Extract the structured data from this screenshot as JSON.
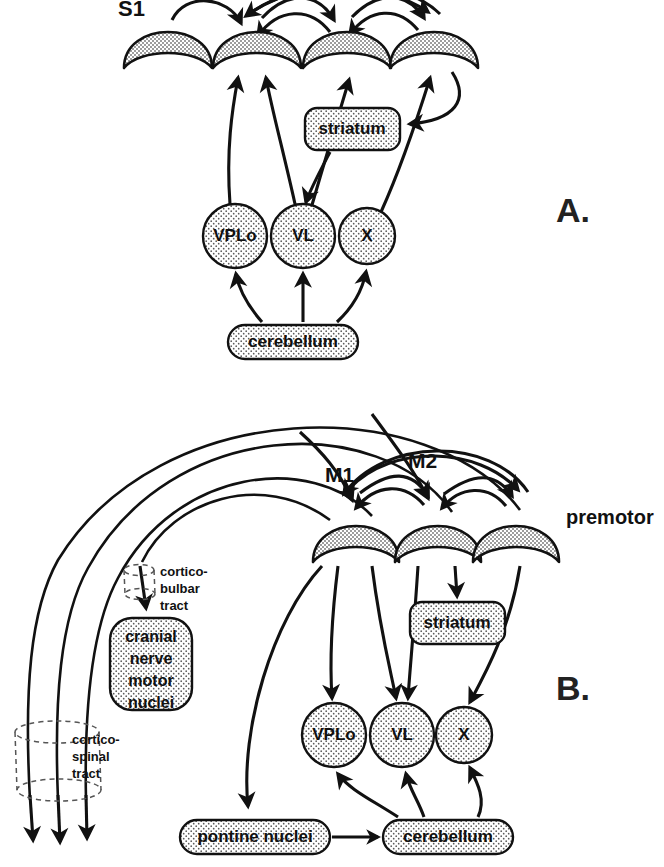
{
  "figure": {
    "background_color": "#ffffff",
    "ink_color": "#111111",
    "cortex_fill": "#c9c9c9",
    "nucleus_fill": "#e9e9e9"
  },
  "panels": [
    {
      "id": "A",
      "label": "A."
    },
    {
      "id": "B",
      "label": "B."
    }
  ],
  "panelA": {
    "panel_label": "A.",
    "cortical_areas": [
      {
        "id": "s1",
        "label": "S1",
        "label_x": 133,
        "label_y": 8,
        "cx": 168,
        "cy": 40
      },
      {
        "id": "a2",
        "label": "",
        "label_x": 0,
        "label_y": 0,
        "cx": 257,
        "cy": 40
      },
      {
        "id": "a3",
        "label": "",
        "label_x": 0,
        "label_y": 0,
        "cx": 347,
        "cy": 40
      },
      {
        "id": "a4",
        "label": "",
        "label_x": 0,
        "label_y": 0,
        "cx": 434,
        "cy": 40
      }
    ],
    "striatum": {
      "label": "striatum",
      "x": 305,
      "y": 108,
      "w": 95,
      "h": 42
    },
    "thalamic_nuclei": [
      {
        "id": "vplo",
        "label": "VPLo",
        "cx": 235,
        "cy": 236,
        "r": 32
      },
      {
        "id": "vl",
        "label": "VL",
        "cx": 303,
        "cy": 236,
        "r": 32
      },
      {
        "id": "x",
        "label": "X",
        "cx": 367,
        "cy": 236,
        "r": 28
      }
    ],
    "cerebellum": {
      "label": "cerebellum",
      "x": 228,
      "y": 325,
      "w": 130,
      "h": 34
    }
  },
  "panelB": {
    "panel_label": "B.",
    "cortical_areas": [
      {
        "id": "m1",
        "label": "M1",
        "label_x": 330,
        "label_y": 462,
        "cx": 355,
        "cy": 535
      },
      {
        "id": "m2",
        "label": "M2",
        "label_x": 413,
        "label_y": 448,
        "cx": 438,
        "cy": 535
      },
      {
        "id": "premotor",
        "label": "premotor",
        "label_x": 560,
        "label_y": 517,
        "cx": 516,
        "cy": 535
      }
    ],
    "striatum": {
      "label": "striatum",
      "x": 410,
      "y": 602,
      "w": 95,
      "h": 42
    },
    "thalamic_nuclei": [
      {
        "id": "vplo",
        "label": "VPLo",
        "cx": 334,
        "cy": 735,
        "r": 32
      },
      {
        "id": "vl",
        "label": "VL",
        "cx": 402,
        "cy": 735,
        "r": 32
      },
      {
        "id": "x",
        "label": "X",
        "cx": 464,
        "cy": 735,
        "r": 28
      }
    ],
    "cerebellum": {
      "label": "cerebellum",
      "x": 383,
      "y": 820,
      "w": 130,
      "h": 34
    },
    "pontine_nuclei": {
      "label": "pontine nuclei",
      "x": 180,
      "y": 820,
      "w": 150,
      "h": 34
    },
    "cranial_nerve_motor_nuclei": {
      "lines": [
        "cranial",
        "nerve",
        "motor",
        "nuclei"
      ],
      "x": 110,
      "y": 618,
      "w": 82,
      "h": 92
    },
    "tracts": [
      {
        "id": "corticobulbar",
        "lines": [
          "cortico-",
          "bulbar",
          "tract"
        ],
        "label_x": 157,
        "label_y": 572
      },
      {
        "id": "corticospinal",
        "lines": [
          "cortico-",
          "spinal",
          "tract"
        ],
        "label_x": 72,
        "label_y": 740
      }
    ]
  },
  "connections_note": {
    "panelA": "Reciprocal corticocortical arcs between S1 and adjacent areas; VPLo, VL and X project up to cortex; striatum receives cortical input and VL is targeted; cerebellum projects to VPLo, VL and X.",
    "panelB": "Reciprocal corticocortical arcs among M1, M2 and premotor; cortex projects down to VPLo, VL, X and striatum; M1 projects via cortico-bulbar tract to cranial nerve motor nuclei and via cortico-spinal tract; M1 projects to pontine nuclei which project to cerebellum; cerebellum projects back to VPLo, VL and X."
  }
}
